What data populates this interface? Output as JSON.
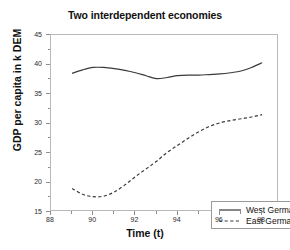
{
  "chart_data": {
    "type": "line",
    "title": "Two interdependent economies",
    "xlabel": "Time (t)",
    "ylabel": "GDP per capita in k DEM",
    "xlim": [
      88,
      98.8
    ],
    "ylim": [
      15,
      45
    ],
    "grid": false,
    "legend_position": "lower-right",
    "x_ticks_major": [
      88,
      90,
      92,
      94,
      96,
      98
    ],
    "x_ticks_minor": [
      89,
      91,
      93,
      95,
      97
    ],
    "y_ticks_major": [
      15,
      20,
      25,
      30,
      35,
      40,
      45
    ],
    "y_ticks_minor": [
      17.5,
      22.5,
      27.5,
      32.5,
      37.5,
      42.5
    ],
    "x": [
      89,
      89.5,
      90,
      90.5,
      91,
      91.5,
      92,
      92.5,
      93,
      93.5,
      94,
      94.5,
      95,
      95.5,
      96,
      96.5,
      97,
      97.5,
      98
    ],
    "series": [
      {
        "name": "West Germany",
        "style": "solid",
        "color": "#3a3a3a",
        "values": [
          38.5,
          39.1,
          39.5,
          39.5,
          39.3,
          39.0,
          38.6,
          38.1,
          37.6,
          37.8,
          38.1,
          38.2,
          38.2,
          38.3,
          38.4,
          38.6,
          38.9,
          39.5,
          40.3
        ]
      },
      {
        "name": "East Germany",
        "style": "dashed",
        "color": "#3a3a3a",
        "values": [
          19.0,
          18.0,
          17.6,
          17.7,
          18.4,
          19.6,
          21.0,
          22.3,
          23.6,
          25.1,
          26.3,
          27.5,
          28.6,
          29.5,
          30.1,
          30.5,
          30.8,
          31.1,
          31.5
        ]
      }
    ]
  },
  "legend": {
    "items": [
      {
        "label": "West Germany",
        "style": "solid"
      },
      {
        "label": "East Germany",
        "style": "dashed"
      }
    ]
  }
}
